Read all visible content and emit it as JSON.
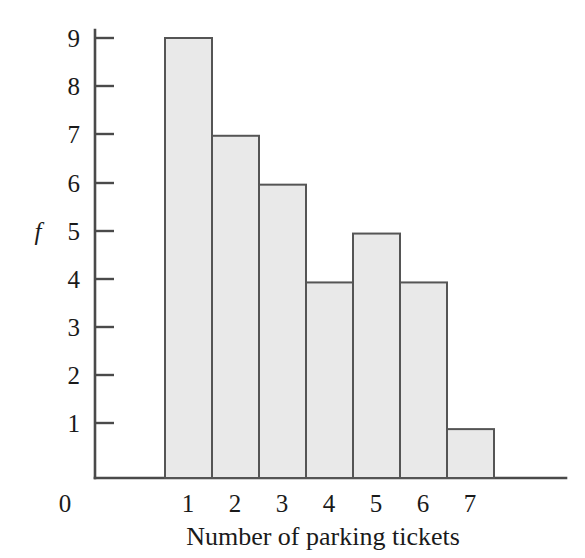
{
  "chart_data": {
    "type": "bar",
    "title": "",
    "subtitle": "",
    "xlabel": "Number of parking tickets",
    "ylabel": "f",
    "categories": [
      "1",
      "2",
      "3",
      "4",
      "5",
      "6",
      "7"
    ],
    "values": [
      9,
      7,
      6,
      4,
      5,
      4,
      1
    ],
    "series": [
      {
        "name": "f",
        "values": [
          9,
          7,
          6,
          4,
          5,
          4,
          1
        ]
      }
    ],
    "y_ticks": [
      "1",
      "2",
      "3",
      "4",
      "5",
      "6",
      "7",
      "8",
      "9"
    ],
    "y_tick_values": [
      1,
      2,
      3,
      4,
      5,
      6,
      7,
      8,
      9
    ],
    "x_tick_labels": [
      "1",
      "2",
      "3",
      "4",
      "5",
      "6",
      "7"
    ],
    "origin_label": "0",
    "ylim": [
      0,
      9
    ],
    "xlim": [
      0,
      7
    ],
    "grid": false,
    "legend": null,
    "legend_position": "none",
    "annotations": [],
    "bar_gap": 0,
    "colors": {
      "bar_fill": "#e9e9e9",
      "bar_stroke": "#555555",
      "axis": "#4a4a4a",
      "text": "#1a1a1a",
      "background": "#ffffff"
    }
  },
  "axes": {
    "y_axis_label": "f",
    "x_axis_caption": "Number of parking tickets",
    "origin": "0"
  }
}
